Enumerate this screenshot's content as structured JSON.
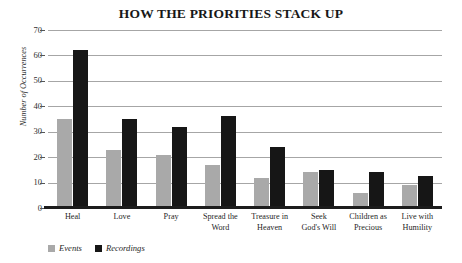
{
  "chart_data": {
    "type": "bar",
    "title": "HOW THE PRIORITIES STACK UP",
    "xlabel": "",
    "ylabel": "Number of Occurrences",
    "ylim": [
      0,
      70
    ],
    "yticks": [
      0,
      10,
      20,
      30,
      40,
      50,
      60,
      70
    ],
    "grid": true,
    "legend_position": "bottom-left",
    "categories": [
      "Heal",
      "Love",
      "Pray",
      "Spread the Word",
      "Treasure in Heaven",
      "Seek God's Will",
      "Children as Precious",
      "Live with Humility"
    ],
    "category_lines": [
      [
        "Heal",
        ""
      ],
      [
        "Love",
        ""
      ],
      [
        "Pray",
        ""
      ],
      [
        "Spread the",
        "Word"
      ],
      [
        "Treasure in",
        "Heaven"
      ],
      [
        "Seek",
        "God's Will"
      ],
      [
        "Children as",
        "Precious"
      ],
      [
        "Live with",
        "Humility"
      ]
    ],
    "series": [
      {
        "name": "Events",
        "color": "#a9a9a9",
        "values": [
          35,
          23,
          21,
          17,
          12,
          14,
          6,
          9
        ]
      },
      {
        "name": "Recordings",
        "color": "#161616",
        "values": [
          62,
          35,
          32,
          36,
          24,
          15,
          14,
          12.5
        ]
      }
    ]
  },
  "legend": {
    "items": [
      {
        "label": "Events",
        "swatch": "events"
      },
      {
        "label": "Recordings",
        "swatch": "recordings"
      }
    ]
  }
}
